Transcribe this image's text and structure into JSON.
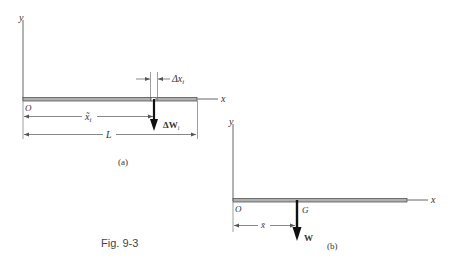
{
  "figure": {
    "caption": "Fig. 9-3",
    "colors": {
      "bar_fill": "#b0b0b0",
      "bar_stroke": "#555555",
      "line": "#666666",
      "arrow": "#111111",
      "text": "#333333"
    },
    "panel_a": {
      "tag": "(a)",
      "y_axis_label": "y",
      "x_axis_label": "x",
      "origin_label": "O",
      "element_width_label": "Δx",
      "element_width_sub": "i",
      "element_position_label": "x̃",
      "element_position_sub": "i",
      "length_label": "L",
      "force_label": "ΔW",
      "force_sub": "i"
    },
    "panel_b": {
      "tag": "(b)",
      "y_axis_label": "y",
      "x_axis_label": "x",
      "origin_label": "O",
      "center_label": "G",
      "centroid_position_label": "x̄",
      "force_label": "W"
    }
  }
}
